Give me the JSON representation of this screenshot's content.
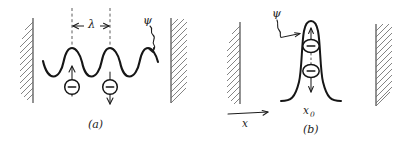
{
  "figure": {
    "background_color": "#ffffff",
    "ink_color": "#161616",
    "hatch_color": "#6e6e6e",
    "width": 407,
    "height": 142
  },
  "panel_a": {
    "caption": "(a)",
    "wavelength_label": "λ",
    "wavefunction_label": "ψ",
    "wave": {
      "type": "sinusoid",
      "periods": 3,
      "amplitude": 13,
      "baseline_y": 62,
      "x_start": 43,
      "x_end": 158
    },
    "charges": [
      {
        "symbol": "−",
        "arrow": "up",
        "name": "electron-up"
      },
      {
        "symbol": "−",
        "arrow": "down",
        "name": "electron-down"
      }
    ],
    "walls": [
      {
        "side": "left",
        "hatch_direction": "outward-left"
      },
      {
        "side": "right",
        "hatch_direction": "outward-right"
      }
    ]
  },
  "panel_b": {
    "caption": "(b)",
    "wavefunction_label": "ψ",
    "position_label": "x",
    "position_subscript": "0",
    "packet": {
      "type": "narrow-peak",
      "center_x": 311,
      "baseline_y": 100,
      "peak_y": 22,
      "half_width": 12
    },
    "charges": [
      {
        "symbol": "−",
        "arrow": "up",
        "name": "electron-up"
      },
      {
        "symbol": "−",
        "arrow": "down",
        "name": "electron-down"
      }
    ],
    "walls": [
      {
        "side": "left",
        "hatch_direction": "outward-left"
      },
      {
        "side": "right",
        "hatch_direction": "outward-right"
      }
    ]
  },
  "axis": {
    "label": "x",
    "direction": "right"
  }
}
